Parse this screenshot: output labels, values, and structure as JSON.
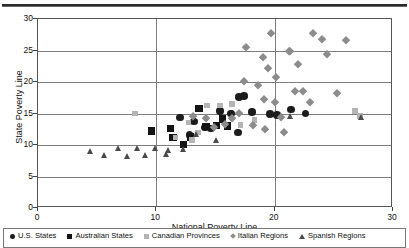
{
  "chart_data": {
    "type": "scatter",
    "title": "",
    "xlabel": "National Poverty Line",
    "ylabel": "State Poverty Line",
    "xlim": [
      0,
      30
    ],
    "ylim": [
      0,
      30
    ],
    "xticks": [
      0,
      10,
      20,
      30
    ],
    "yticks": [
      0,
      5,
      10,
      15,
      20,
      25,
      30
    ],
    "grid": true,
    "legend_position": "bottom",
    "series": [
      {
        "name": "U.S. States",
        "marker": "circle",
        "color": "#1c1c1c",
        "points": [
          [
            12.0,
            14.4
          ],
          [
            13.2,
            13.7
          ],
          [
            14.6,
            12.6
          ],
          [
            15.4,
            15.4
          ],
          [
            16.3,
            15.0
          ],
          [
            17.4,
            17.8
          ],
          [
            17.0,
            17.6
          ],
          [
            18.1,
            15.2
          ],
          [
            19.6,
            14.9
          ],
          [
            21.4,
            15.6
          ],
          [
            22.6,
            15.0
          ],
          [
            16.9,
            12.0
          ],
          [
            14.1,
            12.8
          ],
          [
            12.8,
            11.6
          ],
          [
            20.2,
            14.8
          ]
        ]
      },
      {
        "name": "Australian States",
        "marker": "square",
        "color": "#141414",
        "points": [
          [
            9.6,
            12.2
          ],
          [
            11.4,
            11.2
          ],
          [
            12.3,
            10.1
          ],
          [
            13.6,
            15.8
          ],
          [
            14.2,
            12.9
          ],
          [
            15.1,
            13.1
          ],
          [
            15.6,
            14.1
          ],
          [
            16.0,
            13.0
          ],
          [
            11.2,
            12.6
          ],
          [
            12.9,
            11.3
          ]
        ]
      },
      {
        "name": "Canadian Provinces",
        "marker": "square-light",
        "color": "#b4b4b4",
        "points": [
          [
            8.2,
            15.0
          ],
          [
            11.6,
            11.2
          ],
          [
            12.7,
            13.6
          ],
          [
            13.5,
            12.0
          ],
          [
            14.3,
            16.3
          ],
          [
            15.4,
            16.3
          ],
          [
            16.4,
            16.5
          ],
          [
            17.1,
            13.2
          ],
          [
            18.3,
            14.0
          ],
          [
            26.8,
            15.4
          ],
          [
            13.0,
            10.8
          ],
          [
            27.2,
            14.6
          ]
        ]
      },
      {
        "name": "Italian Regions",
        "marker": "diamond",
        "color": "#8c8c8c",
        "points": [
          [
            13.1,
            14.6
          ],
          [
            14.2,
            14.3
          ],
          [
            14.9,
            12.9
          ],
          [
            15.8,
            13.4
          ],
          [
            16.4,
            14.3
          ],
          [
            17.0,
            15.1
          ],
          [
            17.4,
            20.1
          ],
          [
            17.6,
            25.5
          ],
          [
            18.6,
            19.6
          ],
          [
            19.0,
            24.0
          ],
          [
            19.4,
            22.2
          ],
          [
            19.7,
            27.8
          ],
          [
            20.1,
            20.8
          ],
          [
            19.1,
            17.3
          ],
          [
            20.0,
            16.8
          ],
          [
            21.2,
            24.9
          ],
          [
            21.3,
            25.0
          ],
          [
            22.0,
            22.8
          ],
          [
            22.4,
            18.5
          ],
          [
            23.2,
            27.8
          ],
          [
            24.0,
            26.8
          ],
          [
            24.4,
            24.5
          ],
          [
            26.0,
            26.6
          ],
          [
            23.0,
            16.9
          ],
          [
            25.3,
            18.2
          ],
          [
            21.7,
            18.6
          ],
          [
            20.5,
            14.4
          ],
          [
            18.2,
            13.2
          ],
          [
            19.2,
            12.5
          ],
          [
            20.8,
            12.0
          ]
        ]
      },
      {
        "name": "Spanish Regions",
        "marker": "triangle",
        "color": "#4a4a4a",
        "points": [
          [
            4.4,
            9.0
          ],
          [
            5.6,
            8.3
          ],
          [
            6.8,
            9.4
          ],
          [
            7.6,
            8.2
          ],
          [
            8.4,
            9.5
          ],
          [
            9.1,
            8.4
          ],
          [
            9.9,
            9.4
          ],
          [
            10.9,
            8.5
          ],
          [
            12.3,
            9.3
          ],
          [
            13.4,
            11.6
          ],
          [
            15.1,
            10.7
          ],
          [
            21.3,
            14.5
          ],
          [
            27.3,
            14.4
          ],
          [
            11.0,
            9.2
          ]
        ]
      }
    ]
  },
  "axes": {
    "y_title": "State Poverty Line",
    "x_title": "National Poverty Line",
    "y_tick_labels": [
      "0",
      "5",
      "10",
      "15",
      "20",
      "25",
      "30"
    ],
    "x_tick_labels": [
      "0",
      "10",
      "20",
      "30"
    ]
  },
  "legend": {
    "items": [
      {
        "label": "U.S. States",
        "marker": "circle",
        "color": "#1c1c1c"
      },
      {
        "label": "Australian States",
        "marker": "square",
        "color": "#141414"
      },
      {
        "label": "Canadian Provinces",
        "marker": "square-light",
        "color": "#b4b4b4"
      },
      {
        "label": "Italian Regions",
        "marker": "diamond",
        "color": "#8c8c8c"
      },
      {
        "label": "Spanish Regions",
        "marker": "triangle",
        "color": "#4a4a4a"
      }
    ]
  }
}
